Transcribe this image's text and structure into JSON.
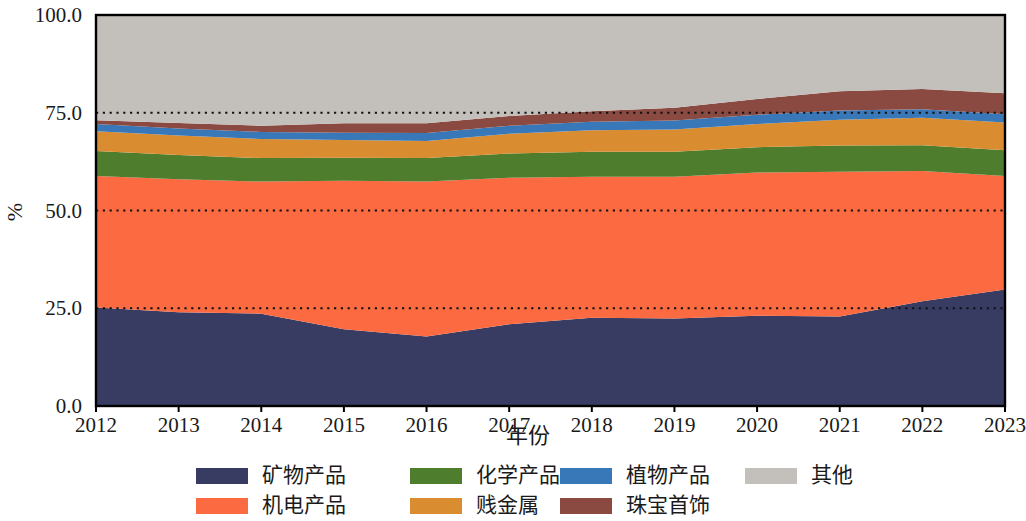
{
  "chart_data": {
    "type": "area",
    "stacked": true,
    "normalized_percent": true,
    "title": "",
    "subtitle": "",
    "xlabel": "年份",
    "ylabel": "%",
    "x": [
      2012,
      2013,
      2014,
      2015,
      2016,
      2017,
      2018,
      2019,
      2020,
      2021,
      2022,
      2023
    ],
    "xtick_labels": [
      "2012",
      "2013",
      "2014",
      "2015",
      "2016",
      "2017",
      "2018",
      "2019",
      "2020",
      "2021",
      "2022",
      "2023"
    ],
    "ytick_labels": [
      "0.0",
      "25.0",
      "50.0",
      "75.0",
      "100.0"
    ],
    "yticks": [
      0,
      25,
      50,
      75,
      100
    ],
    "ylim": [
      0,
      100
    ],
    "xlim": [
      2012,
      2023
    ],
    "grid": true,
    "grid_style": "dotted-horizontal",
    "legend_position": "bottom",
    "legend_columns": 4,
    "series": [
      {
        "name": "矿物产品",
        "color": "#383c63",
        "values": [
          25.2,
          24.0,
          23.6,
          19.6,
          17.8,
          20.9,
          22.6,
          22.4,
          23.1,
          22.9,
          26.8,
          29.8
        ]
      },
      {
        "name": "机电产品",
        "color": "#fb6a40",
        "values": [
          33.6,
          34.0,
          33.8,
          38.0,
          39.6,
          37.5,
          36.0,
          36.2,
          36.6,
          37.0,
          33.3,
          29.0
        ]
      },
      {
        "name": "化学产品",
        "color": "#4f7d2e",
        "values": [
          6.4,
          6.2,
          6.0,
          5.9,
          6.0,
          6.2,
          6.4,
          6.4,
          6.5,
          6.7,
          6.6,
          6.6
        ]
      },
      {
        "name": "贱金属",
        "color": "#d98c30",
        "values": [
          5.1,
          5.0,
          4.9,
          4.5,
          4.4,
          5.0,
          5.5,
          5.7,
          5.9,
          6.6,
          7.0,
          7.1
        ]
      },
      {
        "name": "植物产品",
        "color": "#3878b8",
        "values": [
          1.8,
          1.8,
          1.8,
          1.9,
          2.0,
          2.1,
          2.2,
          2.3,
          2.4,
          2.4,
          2.2,
          2.1
        ]
      },
      {
        "name": "珠宝首饰",
        "color": "#8a4a42",
        "values": [
          1.0,
          1.4,
          1.6,
          2.4,
          2.5,
          2.5,
          2.7,
          3.3,
          4.0,
          4.9,
          5.2,
          5.4
        ]
      },
      {
        "name": "其他",
        "color": "#c3c0bb",
        "values": [
          26.9,
          27.6,
          28.3,
          27.7,
          27.7,
          25.8,
          24.6,
          23.7,
          21.5,
          19.5,
          18.9,
          20.0
        ]
      }
    ]
  },
  "axes": {
    "y_title": "%",
    "x_title": "年份"
  },
  "legend": {
    "items": [
      {
        "label": "矿物产品",
        "color": "#383c63"
      },
      {
        "label": "化学产品",
        "color": "#4f7d2e"
      },
      {
        "label": "植物产品",
        "color": "#3878b8"
      },
      {
        "label": "其他",
        "color": "#c3c0bb"
      },
      {
        "label": "机电产品",
        "color": "#fb6a40"
      },
      {
        "label": "贱金属",
        "color": "#d98c30"
      },
      {
        "label": "珠宝首饰",
        "color": "#8a4a42"
      }
    ]
  }
}
